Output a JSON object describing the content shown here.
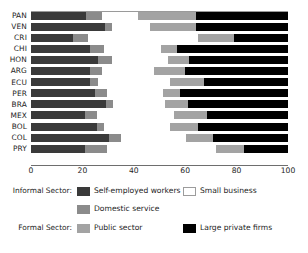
{
  "chart_data": {
    "type": "bar",
    "orientation": "horizontal",
    "stacked": true,
    "normalized": true,
    "title": "",
    "xlabel": "",
    "ylabel": "",
    "xlim": [
      0,
      100
    ],
    "xticks": [
      0,
      20,
      40,
      60,
      80,
      100
    ],
    "grid": false,
    "legend_position": "bottom",
    "categories": [
      "PAN",
      "VEN",
      "CRI",
      "CHI",
      "HON",
      "ARG",
      "ECU",
      "PER",
      "BRA",
      "MEX",
      "BOL",
      "COL",
      "PRY"
    ],
    "series": [
      {
        "name": "Self-employed workers",
        "group": "Informal Sector",
        "color": "#3a3a3a",
        "values": [
          21.4,
          28.8,
          16.5,
          23.0,
          26.0,
          23.0,
          23.0,
          25.0,
          29.0,
          21.0,
          25.5,
          30.5,
          21.0
        ]
      },
      {
        "name": "Domestic service",
        "group": "Informal Sector",
        "color": "#8b8b8b",
        "values": [
          6.2,
          2.7,
          5.5,
          5.5,
          5.5,
          4.5,
          3.0,
          4.5,
          3.0,
          4.5,
          3.0,
          4.5,
          8.5
        ]
      },
      {
        "name": "Small business",
        "group": "Informal Sector",
        "color": "#ffffff",
        "values": [
          14.0,
          14.8,
          43.0,
          22.0,
          22.0,
          20.5,
          28.0,
          22.0,
          20.0,
          30.0,
          25.5,
          25.5,
          42.5
        ]
      },
      {
        "name": "Public sector",
        "group": "Formal Sector",
        "color": "#a3a3a3",
        "values": [
          22.6,
          18.0,
          14.0,
          6.5,
          8.0,
          12.0,
          13.5,
          6.5,
          9.0,
          13.0,
          11.0,
          10.5,
          11.0
        ]
      },
      {
        "name": "Large private firms",
        "group": "Formal Sector",
        "color": "#000000",
        "values": [
          35.8,
          35.7,
          21.0,
          43.0,
          38.5,
          40.0,
          32.5,
          42.0,
          39.0,
          31.5,
          35.0,
          29.0,
          17.0
        ]
      }
    ]
  },
  "legend": {
    "informal_label": "Informal Sector:",
    "formal_label": "Formal Sector:",
    "entries": {
      "self_employed": "Self-employed workers",
      "small_business": "Small business",
      "domestic_service": "Domestic service",
      "public_sector": "Public sector",
      "large_private": "Large private firms"
    }
  }
}
